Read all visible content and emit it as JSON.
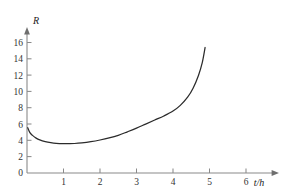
{
  "chart_data": {
    "type": "line",
    "title": "",
    "xlabel": "t/h",
    "ylabel": "R",
    "xlim": [
      0,
      6.6
    ],
    "ylim": [
      0,
      17
    ],
    "grid": false,
    "legend": null,
    "x_ticks": [
      "1",
      "2",
      "3",
      "4",
      "5",
      "6"
    ],
    "x_tick_values": [
      1,
      2,
      3,
      4,
      5,
      6
    ],
    "y_ticks": [
      "0",
      "2",
      "4",
      "6",
      "8",
      "10",
      "12",
      "14",
      "16"
    ],
    "y_tick_values": [
      0,
      2,
      4,
      6,
      8,
      10,
      12,
      14,
      16
    ],
    "origin_label": "0",
    "series": [
      {
        "name": "R(t)",
        "color": "#2b2b2b",
        "points": [
          [
            0.02,
            5.55
          ],
          [
            0.08,
            4.95
          ],
          [
            0.15,
            4.62
          ],
          [
            0.25,
            4.28
          ],
          [
            0.35,
            4.06
          ],
          [
            0.5,
            3.85
          ],
          [
            0.65,
            3.72
          ],
          [
            0.8,
            3.64
          ],
          [
            1.0,
            3.6
          ],
          [
            1.15,
            3.6
          ],
          [
            1.3,
            3.62
          ],
          [
            1.5,
            3.7
          ],
          [
            1.75,
            3.85
          ],
          [
            2.0,
            4.05
          ],
          [
            2.25,
            4.3
          ],
          [
            2.5,
            4.62
          ],
          [
            2.75,
            5.05
          ],
          [
            3.0,
            5.5
          ],
          [
            3.25,
            6.0
          ],
          [
            3.5,
            6.5
          ],
          [
            3.75,
            7.0
          ],
          [
            4.0,
            7.6
          ],
          [
            4.2,
            8.3
          ],
          [
            4.4,
            9.3
          ],
          [
            4.55,
            10.4
          ],
          [
            4.7,
            12.0
          ],
          [
            4.8,
            13.5
          ],
          [
            4.88,
            15.4
          ]
        ]
      }
    ],
    "minimum": {
      "t": 1.1,
      "R": 3.6
    },
    "axis_colors": {
      "axis": "#8a8a8a",
      "curve": "#2b2b2b",
      "text": "#333333",
      "background": "#ffffff"
    }
  }
}
